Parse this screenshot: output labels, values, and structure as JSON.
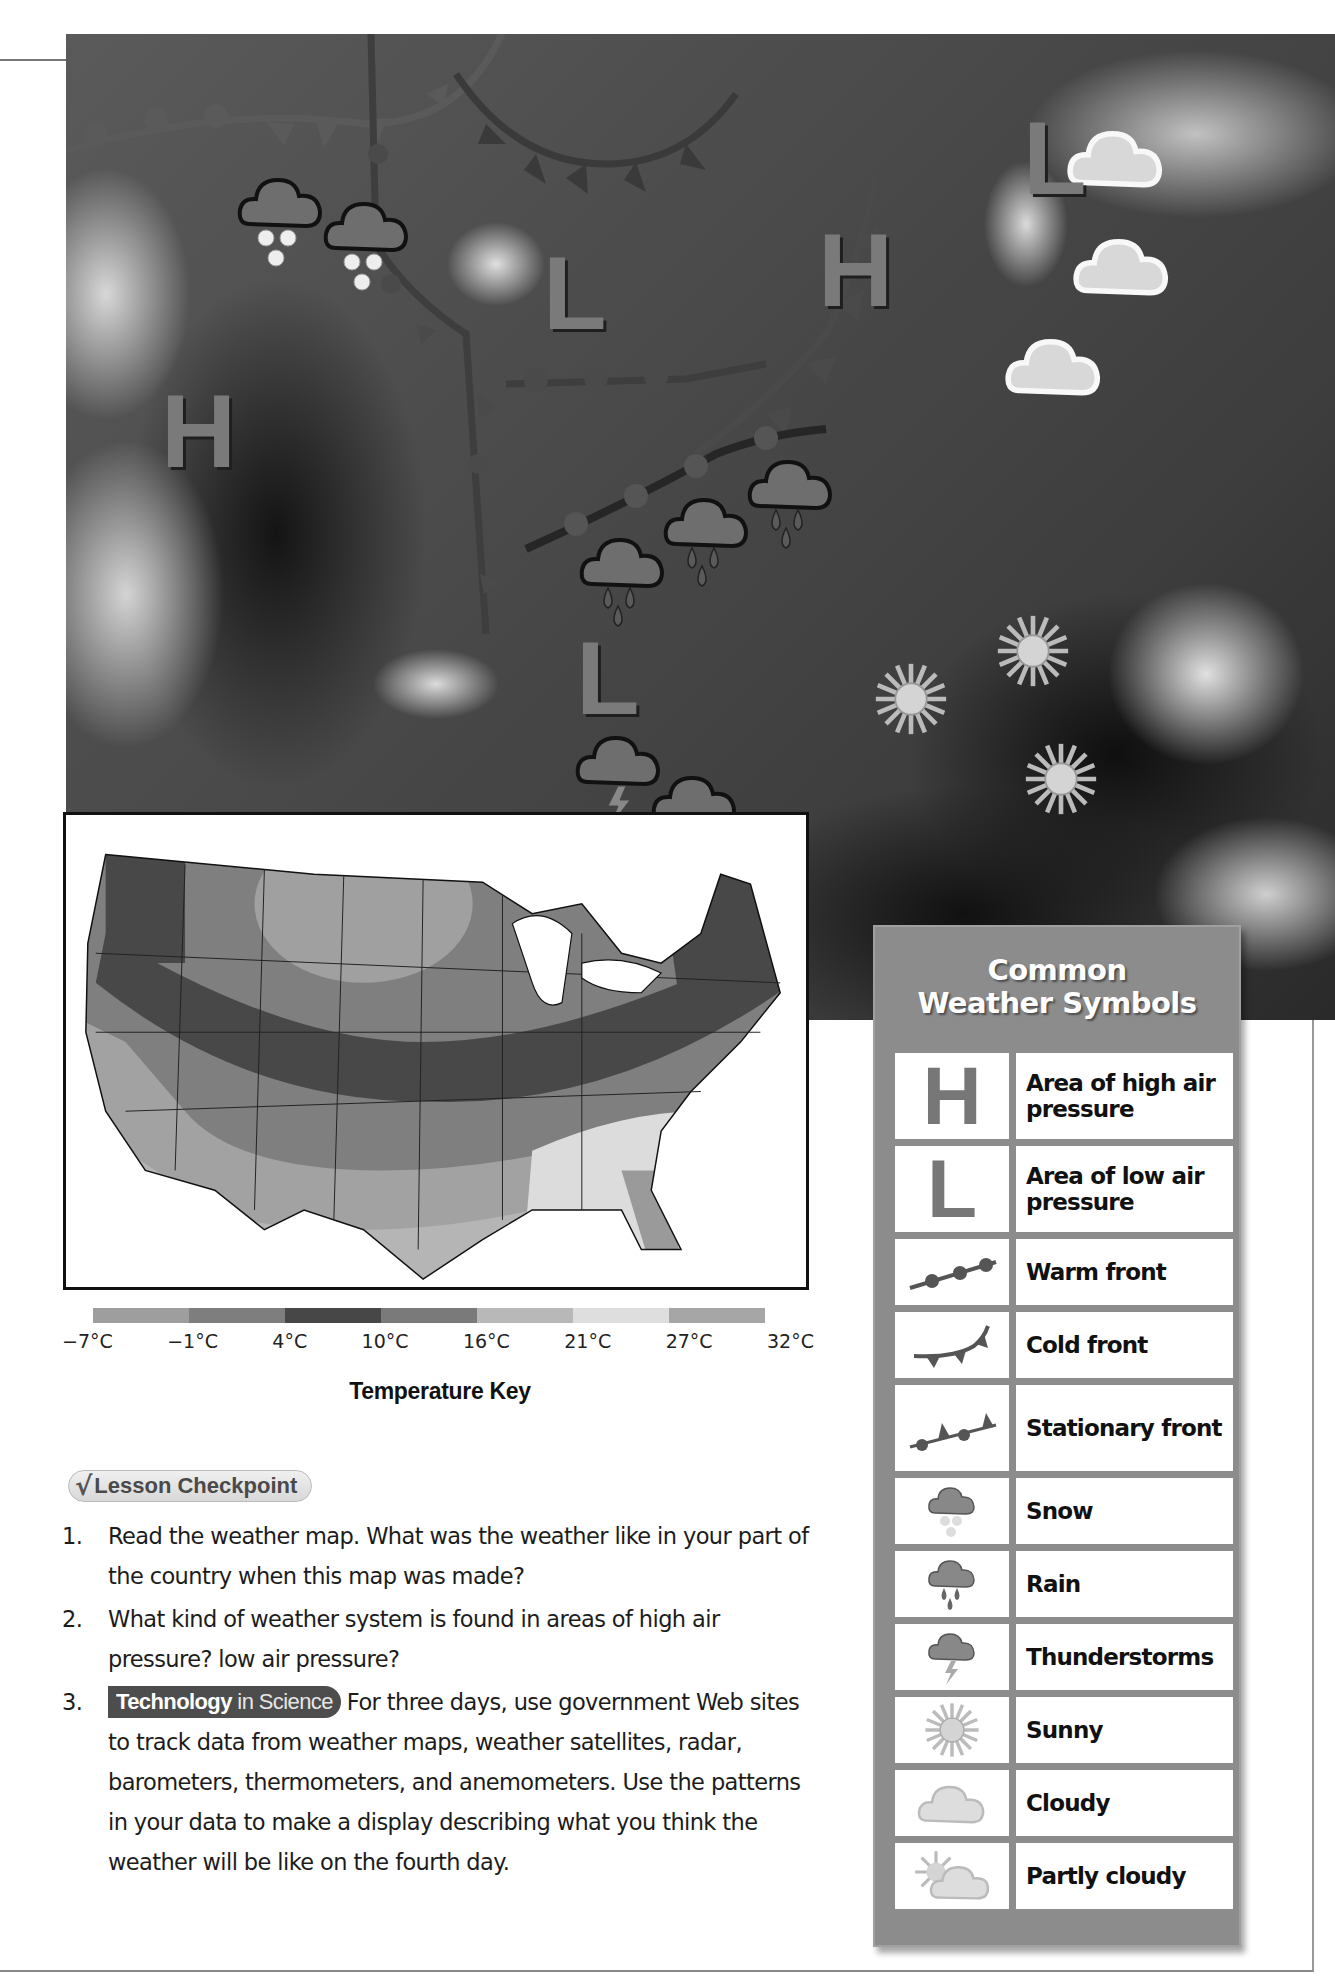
{
  "satellite_map": {
    "pressure_markers": [
      {
        "letter": "H",
        "x": 95,
        "y": 345
      },
      {
        "letter": "L",
        "x": 477,
        "y": 207
      },
      {
        "letter": "H",
        "x": 752,
        "y": 184
      },
      {
        "letter": "L",
        "x": 957,
        "y": 72
      },
      {
        "letter": "L",
        "x": 510,
        "y": 592
      }
    ],
    "weather_icons": [
      {
        "type": "snow",
        "x": 237,
        "y": 178
      },
      {
        "type": "snow",
        "x": 323,
        "y": 203
      },
      {
        "type": "cloudy",
        "x": 1070,
        "y": 122
      },
      {
        "type": "cloudy",
        "x": 1075,
        "y": 232
      },
      {
        "type": "cloudy",
        "x": 1010,
        "y": 330
      },
      {
        "type": "rain",
        "x": 580,
        "y": 540
      },
      {
        "type": "rain",
        "x": 669,
        "y": 499
      },
      {
        "type": "rain",
        "x": 762,
        "y": 462
      },
      {
        "type": "sunny",
        "x": 975,
        "y": 630
      },
      {
        "type": "sunny",
        "x": 870,
        "y": 700
      },
      {
        "type": "sunny",
        "x": 1010,
        "y": 765
      },
      {
        "type": "thunderstorms",
        "x": 580,
        "y": 735
      },
      {
        "type": "rain",
        "x": 653,
        "y": 780
      }
    ]
  },
  "temperature_map": {
    "key_title": "Temperature Key",
    "key_labels": [
      "−7°C",
      "−1°C",
      "4°C",
      "10°C",
      "16°C",
      "21°C",
      "27°C",
      "32°C"
    ],
    "key_colors": [
      "#9e9e9e",
      "#7e7e7e",
      "#474747",
      "#7a7a7a",
      "#b8b8b8",
      "#dedede",
      "#a6a6a6"
    ]
  },
  "lesson_checkpoint": {
    "badge_label": "Lesson Checkpoint",
    "questions": [
      {
        "num": "1.",
        "text": "Read the weather map. What was the weather like in your part of the country when this map was made?"
      },
      {
        "num": "2.",
        "text": "What kind of weather system is found in areas of high air pressure? low air pressure?"
      },
      {
        "num": "3.",
        "badge_bold": "Technology",
        "badge_rest": " in Science",
        "text": "For three days, use government Web sites to track data from weather maps, weather satellites, radar, barometers, thermometers, and anemometers. Use the patterns in your data to make a display describing what you think the weather will be like on the fourth day."
      }
    ]
  },
  "legend": {
    "title_line1": "Common",
    "title_line2": "Weather Symbols",
    "rows": [
      {
        "icon": "H",
        "label": "Area of high air pressure"
      },
      {
        "icon": "L",
        "label": "Area of low air pressure"
      },
      {
        "icon": "warm-front",
        "label": "Warm front"
      },
      {
        "icon": "cold-front",
        "label": "Cold front"
      },
      {
        "icon": "stationary-front",
        "label": "Stationary front"
      },
      {
        "icon": "snow",
        "label": "Snow"
      },
      {
        "icon": "rain",
        "label": "Rain"
      },
      {
        "icon": "thunderstorms",
        "label": "Thunderstorms"
      },
      {
        "icon": "sunny",
        "label": "Sunny"
      },
      {
        "icon": "cloudy",
        "label": "Cloudy"
      },
      {
        "icon": "partly-cloudy",
        "label": "Partly cloudy"
      }
    ]
  }
}
